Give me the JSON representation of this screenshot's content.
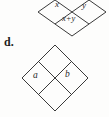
{
  "figure": {
    "name": "diamond-problem-figure",
    "item_label": "d.",
    "background_color": "#fdfdfc",
    "stroke_color": "#3a3a3a",
    "text_color": "#2b2b2b",
    "diagrams": [
      {
        "name": "example-diamond",
        "cropped": true,
        "note": "partially cut off at top of image",
        "cells": {
          "top": "",
          "left": "x",
          "right": "y",
          "bottom": "x+y"
        }
      },
      {
        "name": "exercise-diamond",
        "cropped": false,
        "cells": {
          "top": "",
          "left": "a",
          "right": "b",
          "bottom": ""
        }
      }
    ]
  }
}
